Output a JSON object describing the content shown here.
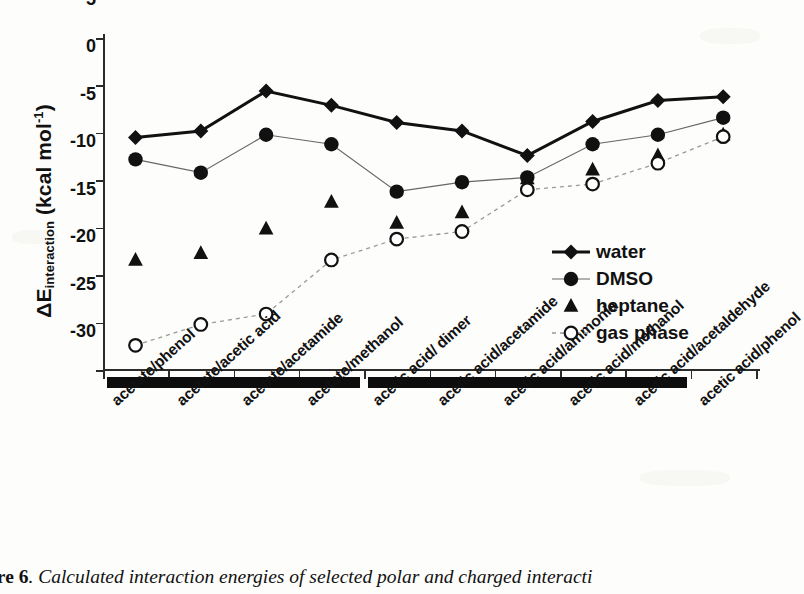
{
  "figure": {
    "caption_prefix": "ure 6",
    "caption_text": ". Calculated interaction energies of selected polar and charged interacti"
  },
  "axes": {
    "ylabel_delta": "ΔE",
    "ylabel_sub": "interaction",
    "ylabel_units": " (kcal mol",
    "ylabel_sup": "-1",
    "ylabel_close": ")",
    "yticks": [
      5,
      0,
      -5,
      -10,
      -15,
      -20,
      -25,
      -30
    ],
    "ymin": -30,
    "ymax": 5
  },
  "legend": {
    "position": "inside-right",
    "items": [
      {
        "name": "water",
        "marker": "diamond-filled",
        "line": "solid"
      },
      {
        "name": "DMSO",
        "marker": "circle-filled",
        "line": "none"
      },
      {
        "name": "heptane",
        "marker": "triangle-filled",
        "line": "none"
      },
      {
        "name": "gas phase",
        "marker": "circle-open",
        "line": "dotted"
      }
    ]
  },
  "groups": [
    {
      "label": "acetate",
      "start_index": 0,
      "end_index": 3
    },
    {
      "label": "acetic acid",
      "start_index": 4,
      "end_index": 8
    }
  ],
  "chart_data": {
    "type": "line",
    "title": "",
    "xlabel": "",
    "ylabel": "ΔEinteraction (kcal mol-1)",
    "ylim": [
      -30,
      5
    ],
    "grid": false,
    "legend_position": "inside-right",
    "categories": [
      "acetate/phenol",
      "acetate/acetic acid",
      "acetate/acetamide",
      "acetate/methanol",
      "acetic acid/ dimer",
      "acetic acid/acetamide",
      "acetic acid/ammonia",
      "acetic acid/methanol",
      "acetic acid/acetaldehyde",
      "acetic acid/phenol"
    ],
    "series": [
      {
        "name": "water",
        "marker": "diamond-filled",
        "line": "solid",
        "values": [
          -5.5,
          -4.8,
          -0.6,
          -2.1,
          -3.9,
          -4.8,
          -7.4,
          -3.8,
          -1.6,
          -1.2
        ]
      },
      {
        "name": "DMSO",
        "marker": "circle-filled",
        "line": "thin-solid",
        "values": [
          -7.8,
          -9.2,
          -5.2,
          -6.2,
          -11.2,
          -10.2,
          -9.7,
          -6.2,
          -5.2,
          -3.4
        ]
      },
      {
        "name": "heptane",
        "marker": "triangle-filled",
        "line": "none",
        "values": [
          -18.4,
          -17.7,
          -15.1,
          -12.3,
          -14.5,
          -13.4,
          -9.8,
          -8.9,
          -7.4,
          -5.2
        ]
      },
      {
        "name": "gas phase",
        "marker": "circle-open",
        "line": "dotted",
        "values": [
          -27.4,
          -25.2,
          -24.1,
          -18.4,
          -16.2,
          -15.4,
          -11.0,
          -10.4,
          -8.2,
          -5.4
        ]
      }
    ]
  }
}
